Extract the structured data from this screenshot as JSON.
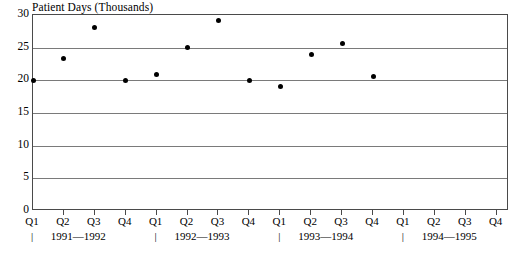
{
  "chart_data": {
    "type": "scatter",
    "title": "",
    "ylabel": "Patient Days (Thousands)",
    "xlabel": "",
    "ylim": [
      0,
      30
    ],
    "y_ticks": [
      0,
      5,
      10,
      15,
      20,
      25,
      30
    ],
    "grid": true,
    "legend": null,
    "categories": [
      "Q1",
      "Q2",
      "Q3",
      "Q4",
      "Q1",
      "Q2",
      "Q3",
      "Q4",
      "Q1",
      "Q2",
      "Q3",
      "Q4",
      "Q1",
      "Q2",
      "Q3",
      "Q4"
    ],
    "period_labels": [
      "1991—1992",
      "1992—1993",
      "1993—1994",
      "1994—1995"
    ],
    "period_delimiter": "|",
    "values": [
      20.0,
      23.4,
      28.1,
      19.9,
      20.9,
      25.0,
      29.2,
      20.0,
      19.1,
      24.0,
      25.6,
      20.6,
      null,
      null,
      null,
      null
    ],
    "points": [
      {
        "x": "Q1 1991—1992",
        "y": 20.0
      },
      {
        "x": "Q2 1991—1992",
        "y": 23.4
      },
      {
        "x": "Q3 1991—1992",
        "y": 28.1
      },
      {
        "x": "Q4 1991—1992",
        "y": 19.9
      },
      {
        "x": "Q1 1992—1993",
        "y": 20.9
      },
      {
        "x": "Q2 1992—1993",
        "y": 25.0
      },
      {
        "x": "Q3 1992—1993",
        "y": 29.2
      },
      {
        "x": "Q4 1992—1993",
        "y": 20.0
      },
      {
        "x": "Q1 1993—1994",
        "y": 19.1
      },
      {
        "x": "Q2 1993—1994",
        "y": 24.0
      },
      {
        "x": "Q3 1993—1994",
        "y": 25.6
      },
      {
        "x": "Q4 1993—1994",
        "y": 20.6
      }
    ]
  },
  "axis": {
    "y_tick_labels": [
      "30",
      "25",
      "20",
      "15",
      "10",
      "5",
      "0"
    ]
  },
  "caption": {
    "text": ""
  },
  "colors": {
    "marker": "#000000",
    "gridline": "#7a7a7a",
    "frame": "#4a4a4a",
    "background": "#ffffff"
  }
}
